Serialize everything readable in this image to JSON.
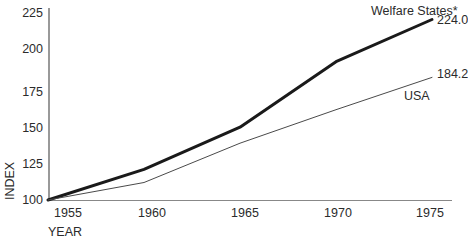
{
  "chart_data": {
    "type": "line",
    "title": "",
    "xlabel": "YEAR",
    "ylabel": "INDEX",
    "x": [
      1955,
      1960,
      1965,
      1970,
      1975
    ],
    "xticklabels": [
      "1955",
      "1960",
      "1965",
      "1970",
      "1975"
    ],
    "xlim": [
      1955,
      1975
    ],
    "ylim": [
      100,
      225
    ],
    "yticks": [
      100,
      125,
      150,
      175,
      200,
      225
    ],
    "yticklabels": [
      "100",
      "125",
      "150",
      "175",
      "200",
      "225"
    ],
    "grid": false,
    "legend_position": "inline-end-labels",
    "series": [
      {
        "name": "Welfare States*",
        "values": [
          100.0,
          121.0,
          150.0,
          195.0,
          224.0
        ],
        "end_value_label": "224.0",
        "style": "thick",
        "color": "#1a1a1a",
        "linewidth": 3
      },
      {
        "name": "USA",
        "values": [
          100.0,
          112.0,
          139.0,
          162.0,
          184.2
        ],
        "end_value_label": "184.2",
        "style": "thin",
        "color": "#4a4a4a",
        "linewidth": 1
      }
    ],
    "annotations": [
      {
        "text": "Welfare States*",
        "x": 372,
        "y": 14
      },
      {
        "text": "224.0",
        "x": 438,
        "y": 24
      },
      {
        "text": "184.2",
        "x": 438,
        "y": 78
      },
      {
        "text": "USA",
        "x": 404,
        "y": 99
      }
    ]
  },
  "axes": {
    "ytick_labels": [
      "225",
      "200",
      "175",
      "150",
      "125",
      "100"
    ],
    "xtick_labels": [
      "1955",
      "1960",
      "1965",
      "1970",
      "1975"
    ],
    "x_axis_title": "YEAR",
    "y_axis_title": "INDEX"
  },
  "colors": {
    "background": "#ffffff",
    "axis": "#555555",
    "text": "#2b2b2b",
    "series_primary": "#1a1a1a",
    "series_secondary": "#4a4a4a"
  }
}
